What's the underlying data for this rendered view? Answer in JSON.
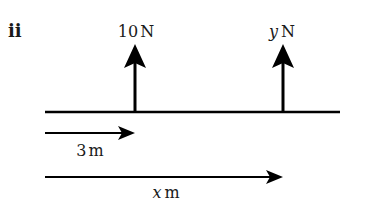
{
  "part_label": "ii",
  "forces": [
    {
      "magnitude": "10",
      "variable": "",
      "unit": "N",
      "position_m": "3"
    },
    {
      "magnitude": "",
      "variable": "y",
      "unit": "N",
      "position_m": "x"
    }
  ],
  "distances": [
    {
      "value": "3",
      "variable": "",
      "unit": "m"
    },
    {
      "value": "",
      "variable": "x",
      "unit": "m"
    }
  ],
  "colors": {
    "ink": "#000000",
    "background": "#ffffff"
  }
}
